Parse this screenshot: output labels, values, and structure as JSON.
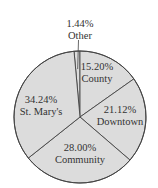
{
  "chart_data": {
    "type": "pie",
    "title": "",
    "categories": [
      "Other",
      "County",
      "Downtown",
      "Community",
      "St. Mary's"
    ],
    "values": [
      1.44,
      15.2,
      21.12,
      28.0,
      34.24
    ],
    "labels": [
      {
        "pct": "1.44%",
        "name": "Other"
      },
      {
        "pct": "15.20%",
        "name": "County"
      },
      {
        "pct": "21.12%",
        "name": "Downtown"
      },
      {
        "pct": "28.00%",
        "name": "Community"
      },
      {
        "pct": "34.24%",
        "name": "St. Mary's"
      }
    ],
    "unit": "%",
    "legend": "none",
    "start_angle_deg": -95.2,
    "direction": "clockwise"
  },
  "style": {
    "fill": "#dcdcdc",
    "stroke": "#444444",
    "text": "#333333",
    "background": "#ffffff"
  },
  "geometry": {
    "cx": 80,
    "cy": 117,
    "r": 66
  },
  "label_positions": [
    {
      "x": 80,
      "y": 18,
      "leader": true
    },
    {
      "x": 97,
      "y": 61
    },
    {
      "x": 120,
      "y": 104
    },
    {
      "x": 80,
      "y": 142
    },
    {
      "x": 41,
      "y": 94
    }
  ]
}
